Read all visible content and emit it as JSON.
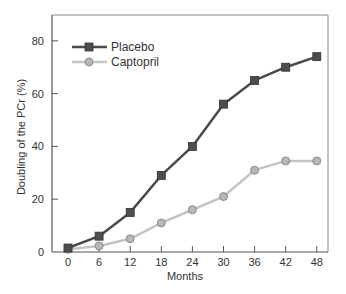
{
  "chart_data": {
    "type": "line",
    "title": "",
    "xlabel": "Months",
    "ylabel": "Doubling of the PCr (%)",
    "x": [
      0,
      6,
      12,
      18,
      24,
      30,
      36,
      42,
      48
    ],
    "x_ticks": [
      "0",
      "6",
      "12",
      "18",
      "24",
      "30",
      "36",
      "42",
      "48"
    ],
    "y_ticks": [
      "0",
      "20",
      "40",
      "60",
      "80"
    ],
    "xlim": [
      0,
      48
    ],
    "ylim": [
      0,
      90
    ],
    "grid": false,
    "legend_position": "upper left",
    "series": [
      {
        "name": "Placebo",
        "marker": "square",
        "line_color": "#4a4a4a",
        "marker_color": "#4d4d4d",
        "values": [
          1.5,
          6,
          15,
          29,
          40,
          56,
          65,
          70,
          74
        ]
      },
      {
        "name": "Captopril",
        "marker": "circle",
        "line_color": "#c4c4c4",
        "marker_color": "#b8b8b8",
        "values": [
          1,
          2.3,
          5,
          11,
          16,
          21,
          31,
          34.5,
          34.5
        ]
      }
    ]
  },
  "legend": {
    "items": [
      "Placebo",
      "Captopril"
    ]
  },
  "colors": {
    "axis": "#555555",
    "frame": "#888888"
  }
}
